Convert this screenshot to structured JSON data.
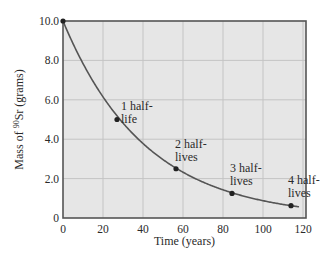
{
  "chart_data": {
    "type": "line",
    "title": "",
    "xlabel": "Time (years)",
    "ylabel": "Mass of 90Sr (grams)",
    "ylabel_parts": {
      "prefix": "Mass of ",
      "superscript": "90",
      "element": "Sr",
      "suffix": " (grams)"
    },
    "xlim": [
      0,
      120
    ],
    "ylim": [
      0,
      10.0
    ],
    "x_ticks": [
      "0",
      "20",
      "40",
      "60",
      "80",
      "100",
      "120"
    ],
    "y_ticks": [
      "0",
      "2.0",
      "4.0",
      "6.0",
      "8.0",
      "10.0"
    ],
    "grid": true,
    "legend": null,
    "series": [
      {
        "name": "Decay curve of 90Sr",
        "half_life_years": 28.5,
        "initial_mass": 10.0,
        "curve_end_x": 118
      }
    ],
    "points": [
      {
        "x": 0,
        "y": 10.0,
        "label": ""
      },
      {
        "x": 27,
        "y": 5.0,
        "label": "1 half-\nlife"
      },
      {
        "x": 56.5,
        "y": 2.5,
        "label": "2 half-\nlives"
      },
      {
        "x": 84.5,
        "y": 1.25,
        "label": "3 half-\nlives"
      },
      {
        "x": 114,
        "y": 0.625,
        "label": "4 half-\nlives"
      }
    ],
    "annotations": [
      {
        "line1": "1 half-",
        "line2": "life"
      },
      {
        "line1": "2 half-",
        "line2": "lives"
      },
      {
        "line1": "3 half-",
        "line2": "lives"
      },
      {
        "line1": "4 half-",
        "line2": "lives"
      }
    ]
  },
  "colors": {
    "plot_background": "#e6e6e6",
    "grid": "#c4c4c4",
    "axis": "#555555",
    "curve": "#555555",
    "point": "#222222"
  }
}
